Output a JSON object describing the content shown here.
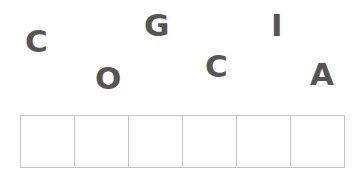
{
  "game": {
    "type": "word-scramble",
    "letters": [
      {
        "char": "C",
        "x": 25,
        "y": 26
      },
      {
        "char": "O",
        "x": 95,
        "y": 63
      },
      {
        "char": "G",
        "x": 144,
        "y": 10
      },
      {
        "char": "C",
        "x": 205,
        "y": 51
      },
      {
        "char": "I",
        "x": 269,
        "y": 10
      },
      {
        "char": "A",
        "x": 310,
        "y": 59
      }
    ],
    "slot_count": 6,
    "slots": [
      "",
      "",
      "",
      "",
      "",
      ""
    ],
    "colors": {
      "letter": "#555555",
      "slot_border": "#c4c4c4",
      "background": "#ffffff"
    }
  }
}
